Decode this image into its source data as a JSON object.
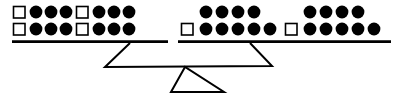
{
  "scene": {
    "title": "Balance scale with tokens",
    "description": "A two-pan balance scale; each pan holds rows of filled circle tokens and open square tokens.",
    "background_color": "#ffffff",
    "ink_color": "#000000",
    "width": 403,
    "height": 97
  },
  "tokens": {
    "circle": {
      "name": "filled-circle-token",
      "fill": "#000000",
      "radius": 6.2
    },
    "square": {
      "name": "open-square-token",
      "fill": "#ffffff",
      "stroke": "#000000",
      "size": 11.5
    }
  },
  "left_pan": {
    "name": "left-pan",
    "beam": {
      "x1": 12,
      "x2": 168,
      "y": 42,
      "thickness": 2.6
    },
    "support": {
      "top_x": 130,
      "top_y": 43,
      "bottom_x": 105,
      "bottom_y": 67
    },
    "total_circles": 12,
    "total_squares": 4,
    "rows": [
      {
        "name": "left-pan-top-row",
        "y": 12,
        "items": [
          "square",
          "circle",
          "circle",
          "circle",
          "square",
          "circle",
          "circle",
          "circle"
        ],
        "x_positions": [
          19,
          36,
          51,
          66,
          82,
          99,
          114,
          129
        ]
      },
      {
        "name": "left-pan-bottom-row",
        "y": 29,
        "items": [
          "square",
          "circle",
          "circle",
          "circle",
          "square",
          "circle",
          "circle",
          "circle"
        ],
        "x_positions": [
          19,
          36,
          51,
          66,
          82,
          99,
          114,
          129
        ]
      }
    ]
  },
  "right_pan": {
    "name": "right-pan",
    "beam": {
      "x1": 178,
      "x2": 391,
      "y": 42,
      "thickness": 2.6
    },
    "support": {
      "top_x": 250,
      "top_y": 43,
      "bottom_x": 272,
      "bottom_y": 67
    },
    "total_circles": 18,
    "total_squares": 2,
    "rows": [
      {
        "name": "right-pan-top-row",
        "y": 12,
        "items": [
          "circle",
          "circle",
          "circle",
          "circle",
          "circle",
          "circle",
          "circle",
          "circle"
        ],
        "x_positions": [
          206,
          222,
          238,
          254,
          310,
          326,
          342,
          358
        ]
      },
      {
        "name": "right-pan-bottom-row",
        "y": 29,
        "items": [
          "square",
          "circle",
          "circle",
          "circle",
          "circle",
          "circle",
          "square",
          "circle",
          "circle",
          "circle",
          "circle",
          "circle"
        ],
        "x_positions": [
          187,
          206,
          222,
          238,
          254,
          270,
          291,
          310,
          326,
          342,
          358,
          374
        ]
      }
    ]
  },
  "stand": {
    "name": "scale-stand",
    "crossbar": {
      "x1": 105,
      "y1": 67,
      "x2": 272,
      "y2": 66
    },
    "fulcrum_triangle": {
      "apex_x": 185,
      "apex_y": 67,
      "base_left_x": 171,
      "base_right_x": 224,
      "base_y": 92
    }
  }
}
